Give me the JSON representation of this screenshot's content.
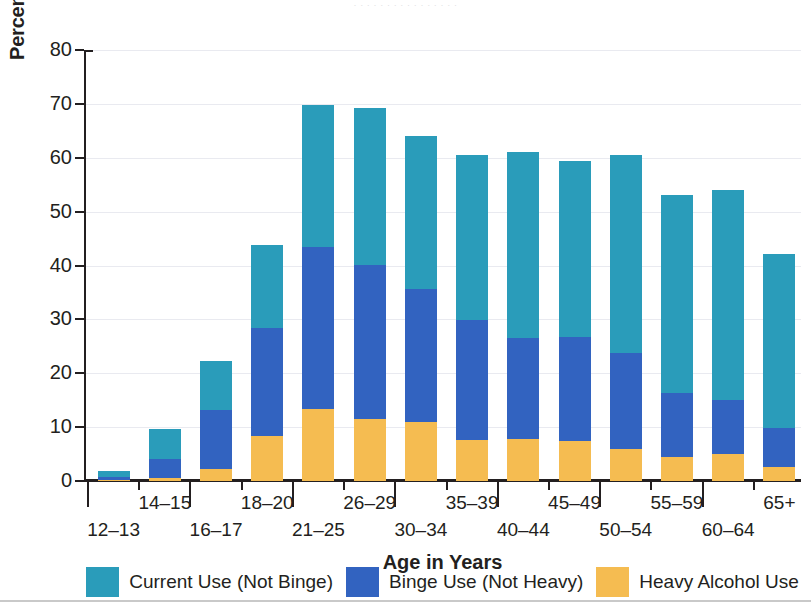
{
  "top_clipped_text": "· · · · · · · · · · · · · · · ·",
  "axes": {
    "y_title": "Percent Using in Past Month",
    "x_title": "Age in Years",
    "y_ticks": [
      0,
      10,
      20,
      30,
      40,
      50,
      60,
      70,
      80
    ],
    "y_min": 0,
    "y_max": 80
  },
  "legend": {
    "items": [
      {
        "label": "Current Use (Not Binge)",
        "color": "#2a9cba",
        "key": "current"
      },
      {
        "label": "Binge Use (Not Heavy)",
        "color": "#3263c0",
        "key": "binge"
      },
      {
        "label": "Heavy Alcohol Use",
        "color": "#f5bc51",
        "key": "heavy"
      }
    ]
  },
  "chart_data": {
    "type": "bar",
    "subtype": "stacked-vertical",
    "title": "",
    "xlabel": "Age in Years",
    "ylabel": "Percent Using in Past Month",
    "ylim": [
      0,
      80
    ],
    "ytick_step": 10,
    "grid": true,
    "legend_position": "bottom",
    "categories": [
      "12–13",
      "14–15",
      "16–17",
      "18–20",
      "21–25",
      "26–29",
      "30–34",
      "35–39",
      "40–44",
      "45–49",
      "50–54",
      "55–59",
      "60–64",
      "65+"
    ],
    "series": [
      {
        "name": "Heavy Alcohol Use",
        "color": "#f5bc51",
        "values": [
          0.2,
          0.6,
          2.3,
          8.4,
          13.4,
          11.5,
          10.9,
          7.6,
          7.8,
          7.4,
          6.0,
          4.5,
          5.0,
          2.6
        ]
      },
      {
        "name": "Binge Use (Not Heavy)",
        "color": "#3263c0",
        "values": [
          0.5,
          3.5,
          10.9,
          20.0,
          30.0,
          28.6,
          24.7,
          22.2,
          18.7,
          19.3,
          17.7,
          11.9,
          10.0,
          7.2
        ]
      },
      {
        "name": "Current Use (Not Binge)",
        "color": "#2a9cba",
        "values": [
          1.1,
          5.6,
          9.1,
          15.4,
          26.3,
          29.1,
          28.4,
          30.8,
          34.6,
          32.7,
          36.8,
          36.7,
          39.1,
          32.4
        ]
      }
    ],
    "totals": [
      1.8,
      9.7,
      22.3,
      43.8,
      69.7,
      69.2,
      64.0,
      60.6,
      61.1,
      59.4,
      60.5,
      53.1,
      54.1,
      42.2
    ],
    "stack_tops": {
      "heavy": [
        0.2,
        0.6,
        2.3,
        8.4,
        13.4,
        11.5,
        10.9,
        7.6,
        7.8,
        7.4,
        6.0,
        4.5,
        5.0,
        2.6
      ],
      "binge": [
        0.7,
        4.1,
        13.2,
        28.4,
        43.4,
        40.1,
        35.6,
        29.8,
        26.5,
        26.7,
        23.7,
        16.4,
        15.0,
        9.8
      ],
      "current": [
        1.8,
        9.7,
        22.3,
        43.8,
        69.7,
        69.2,
        64.0,
        60.6,
        61.1,
        59.4,
        60.5,
        53.1,
        54.1,
        42.2
      ]
    }
  }
}
